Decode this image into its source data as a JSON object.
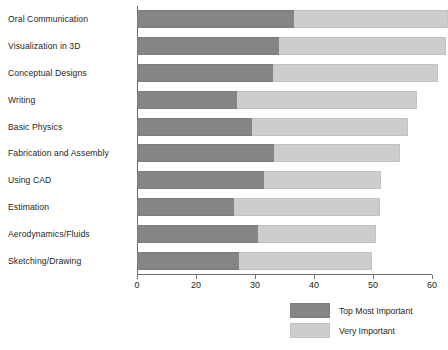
{
  "chart_data": {
    "type": "bar",
    "orientation": "horizontal",
    "stacked": true,
    "title": "",
    "subtitle": "",
    "xlabel": "",
    "ylabel": "",
    "grid": false,
    "xlim": [
      0,
      60
    ],
    "legend_position": "bottom-right",
    "categories": [
      "Oral Communication",
      "Visualization in 3D",
      "Conceptual Designs",
      "Writing",
      "Basic Physics",
      "Fabrication and Assembly",
      "Using CAD",
      "Estimation",
      "Aerodynamics/Fluids",
      "Sketching/Drawing"
    ],
    "xticks": [
      0,
      20,
      30,
      40,
      50,
      60
    ],
    "xtick_labels": [
      "0",
      "20",
      "30",
      "40",
      "50",
      "60"
    ],
    "series": [
      {
        "name": "Top Most Important",
        "color": "#858585",
        "values": [
          26.6,
          24.0,
          23.0,
          17.0,
          19.5,
          23.3,
          21.5,
          16.4,
          20.5,
          17.3
        ]
      },
      {
        "name": "Very Important",
        "color": "#cdcdcd",
        "values": [
          26.1,
          28.4,
          28.0,
          30.5,
          26.4,
          21.3,
          19.8,
          24.8,
          20.0,
          22.5
        ]
      }
    ],
    "totals": [
      52.7,
      52.4,
      51.0,
      47.5,
      45.9,
      44.6,
      41.3,
      41.2,
      40.5,
      39.8
    ]
  }
}
